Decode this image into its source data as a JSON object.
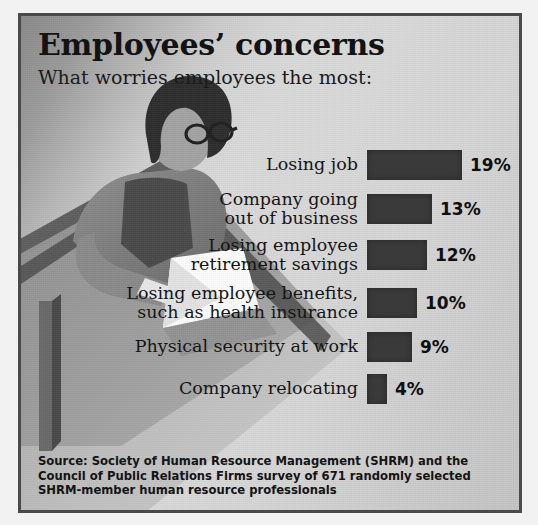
{
  "header": {
    "title": "Employees’ concerns",
    "subtitle": "What worries employees the most:"
  },
  "source": {
    "text": "Source: Society of Human Resource Management (SHRM) and the Council of Public Relations Firms survey of 671 randomly selected SHRM-member human resource professionals"
  },
  "colors": {
    "bar": "#3a3a3a",
    "frame": "#4a4a4a",
    "background": "#cecece",
    "text": "#141414"
  },
  "chart_data": {
    "type": "bar",
    "title": "Employees’ concerns",
    "subtitle": "What worries employees the most:",
    "xlabel": "",
    "ylabel": "",
    "orientation": "horizontal",
    "grid": false,
    "legend": "none",
    "xlim": [
      0,
      20
    ],
    "value_suffix": "%",
    "categories": [
      "Losing job",
      "Company going\nout of business",
      "Losing employee\nretirement savings",
      "Losing employee benefits,\nsuch as health insurance",
      "Physical security at work",
      "Company relocating"
    ],
    "values": [
      19,
      13,
      12,
      10,
      9,
      4
    ],
    "value_labels": [
      "19%",
      "13%",
      "12%",
      "10%",
      "9%",
      "4%"
    ]
  }
}
